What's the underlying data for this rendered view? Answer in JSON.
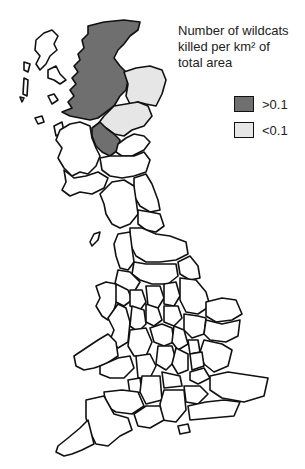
{
  "legend": {
    "title_line1": "Number of wildcats",
    "title_line2": "killed per km² of",
    "title_line3": "total area",
    "items": [
      {
        "label": ">0.1",
        "color": "#6f6f6f"
      },
      {
        "label": "<0.1",
        "color": "#e6e6e6"
      }
    ]
  },
  "map": {
    "subject": "Great Britain counties/regions",
    "regions_high": [
      "Highland",
      "Central/Stirling"
    ],
    "regions_low": [
      "Grampian",
      "Tayside"
    ],
    "regions_no_data_fill": "#ffffff"
  }
}
